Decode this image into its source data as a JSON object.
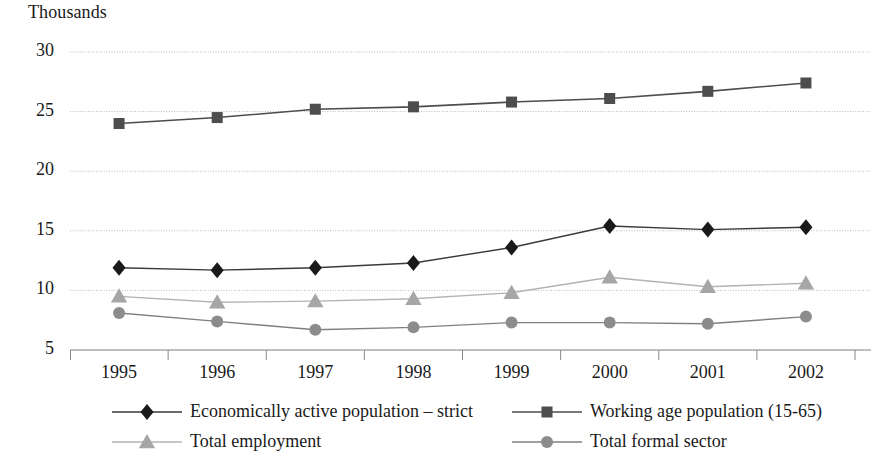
{
  "chart_data": {
    "type": "line",
    "title": "",
    "ylabel": "Thousands",
    "xlabel": "",
    "ylim": [
      5,
      30
    ],
    "yticks": [
      5,
      10,
      15,
      20,
      25,
      30
    ],
    "grid": true,
    "legend_position": "bottom",
    "categories": [
      "1995",
      "1996",
      "1997",
      "1998",
      "1999",
      "2000",
      "2001",
      "2002"
    ],
    "x": [
      1995,
      1996,
      1997,
      1998,
      1999,
      2000,
      2001,
      2002
    ],
    "series": [
      {
        "name": "Economically active population – strict",
        "marker": "diamond",
        "color": "#1a1a1a",
        "line_color": "#3a3a3a",
        "values": [
          11.9,
          11.7,
          11.9,
          12.3,
          13.6,
          15.4,
          15.1,
          15.3
        ]
      },
      {
        "name": "Working age population (15-65)",
        "marker": "square",
        "color": "#4d4d4d",
        "line_color": "#4d4d4d",
        "values": [
          24.0,
          24.5,
          25.2,
          25.4,
          25.8,
          26.1,
          26.7,
          27.4
        ]
      },
      {
        "name": "Total employment",
        "marker": "triangle",
        "color": "#a6a6a6",
        "line_color": "#b3b3b3",
        "values": [
          9.5,
          9.0,
          9.1,
          9.3,
          9.8,
          11.1,
          10.3,
          10.6
        ]
      },
      {
        "name": "Total formal sector",
        "marker": "circle",
        "color": "#8c8c8c",
        "line_color": "#808080",
        "values": [
          8.1,
          7.4,
          6.7,
          6.9,
          7.3,
          7.3,
          7.2,
          7.8
        ]
      }
    ]
  },
  "axis": {
    "y_title": "Thousands",
    "ytick_labels": [
      "30",
      "25",
      "20",
      "15",
      "10",
      "5"
    ],
    "xtick_labels": [
      "1995",
      "1996",
      "1997",
      "1998",
      "1999",
      "2000",
      "2001",
      "2002"
    ]
  },
  "legend": {
    "entries": [
      {
        "label": "Economically active population – strict",
        "marker": "diamond"
      },
      {
        "label": "Working age population (15-65)",
        "marker": "square"
      },
      {
        "label": "Total employment",
        "marker": "triangle"
      },
      {
        "label": "Total formal sector",
        "marker": "circle"
      }
    ]
  },
  "colors": {
    "series1": "#1a1a1a",
    "series2": "#4d4d4d",
    "series3": "#a6a6a6",
    "series4": "#8c8c8c",
    "grid": "#b9b9b9",
    "axis": "#8a8a8a",
    "text": "#1a1a1a",
    "background": "#ffffff"
  }
}
